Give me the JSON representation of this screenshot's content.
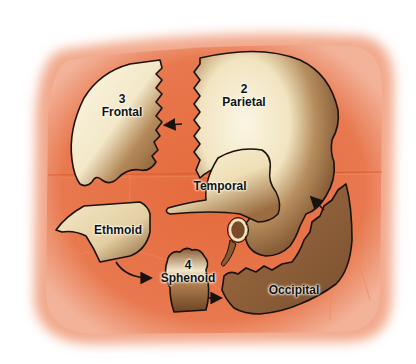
{
  "figure": {
    "colors": {
      "background": "#ffffff",
      "pad": "#e8744a",
      "pad_edge": "#f0a283",
      "bone_light": "#f7f0da",
      "bone_dark": "#8a5a32",
      "outline": "#1a120c"
    },
    "bones": [
      {
        "id": "frontal",
        "number": "3",
        "name": "Frontal"
      },
      {
        "id": "parietal",
        "number": "2",
        "name": "Parietal"
      },
      {
        "id": "temporal",
        "number": "",
        "name": "Temporal"
      },
      {
        "id": "ethmoid",
        "number": "",
        "name": "Ethmoid"
      },
      {
        "id": "sphenoid",
        "number": "4",
        "name": "Sphenoid"
      },
      {
        "id": "occipital",
        "number": "",
        "name": "Occipital"
      }
    ],
    "arrows": [
      {
        "from": "parietal",
        "to": "frontal"
      },
      {
        "from": "ethmoid",
        "to": "sphenoid"
      },
      {
        "from": "sphenoid",
        "to": "occipital"
      },
      {
        "from": "occipital",
        "to": "parietal"
      }
    ]
  }
}
